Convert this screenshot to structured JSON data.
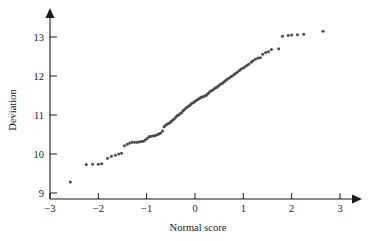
{
  "chart_data": {
    "type": "scatter",
    "title": "",
    "xlabel": "Normal score",
    "ylabel": "Deviation",
    "xlim": [
      -3.2,
      3.3
    ],
    "ylim": [
      8.6,
      13.45
    ],
    "xticks": [
      -3,
      -2,
      -1,
      0,
      1,
      2,
      3
    ],
    "xtick_labels": [
      "−3",
      "−2",
      "−1",
      "0",
      "1",
      "2",
      "3"
    ],
    "yticks": [
      9,
      10,
      11,
      12,
      13
    ],
    "ytick_labels": [
      "9",
      "10",
      "11",
      "12",
      "13"
    ],
    "grid": false,
    "legend": "none",
    "point_color": "#4a4a4a",
    "axis_color": "#1a1a1a",
    "n_points": 100,
    "x": [
      -2.58,
      -2.25,
      -2.12,
      -2.0,
      -1.93,
      -1.81,
      -1.73,
      -1.65,
      -1.58,
      -1.52,
      -1.46,
      -1.4,
      -1.35,
      -1.3,
      -1.25,
      -1.2,
      -1.16,
      -1.11,
      -1.07,
      -1.03,
      -0.99,
      -0.95,
      -0.92,
      -0.88,
      -0.84,
      -0.81,
      -0.77,
      -0.74,
      -0.71,
      -0.67,
      -0.64,
      -0.61,
      -0.58,
      -0.55,
      -0.52,
      -0.49,
      -0.46,
      -0.43,
      -0.4,
      -0.37,
      -0.34,
      -0.31,
      -0.28,
      -0.25,
      -0.23,
      -0.2,
      -0.17,
      -0.14,
      -0.11,
      -0.09,
      -0.06,
      -0.03,
      0.0,
      0.03,
      0.06,
      0.09,
      0.11,
      0.14,
      0.17,
      0.2,
      0.23,
      0.25,
      0.28,
      0.31,
      0.34,
      0.37,
      0.4,
      0.43,
      0.46,
      0.49,
      0.52,
      0.55,
      0.58,
      0.61,
      0.64,
      0.67,
      0.71,
      0.74,
      0.77,
      0.81,
      0.84,
      0.88,
      0.92,
      0.95,
      0.99,
      1.03,
      1.07,
      1.11,
      1.16,
      1.2,
      1.25,
      1.3,
      1.35,
      1.4,
      1.46,
      1.52,
      1.58,
      1.73,
      1.81,
      1.93,
      2.0,
      2.12,
      2.25,
      2.65
    ],
    "y": [
      9.28,
      9.73,
      9.74,
      9.74,
      9.75,
      9.89,
      9.94,
      9.97,
      10.0,
      10.02,
      10.21,
      10.25,
      10.28,
      10.3,
      10.3,
      10.3,
      10.31,
      10.32,
      10.33,
      10.36,
      10.4,
      10.44,
      10.45,
      10.46,
      10.47,
      10.48,
      10.5,
      10.52,
      10.54,
      10.59,
      10.7,
      10.74,
      10.76,
      10.78,
      10.8,
      10.84,
      10.87,
      10.9,
      10.94,
      10.98,
      11.0,
      11.03,
      11.06,
      11.1,
      11.13,
      11.16,
      11.2,
      11.22,
      11.25,
      11.27,
      11.3,
      11.32,
      11.35,
      11.38,
      11.4,
      11.42,
      11.44,
      11.46,
      11.47,
      11.49,
      11.5,
      11.53,
      11.56,
      11.6,
      11.62,
      11.64,
      11.67,
      11.7,
      11.72,
      11.75,
      11.78,
      11.8,
      11.83,
      11.86,
      11.89,
      11.92,
      11.95,
      11.98,
      12.0,
      12.04,
      12.07,
      12.1,
      12.14,
      12.18,
      12.2,
      12.23,
      12.27,
      12.3,
      12.35,
      12.39,
      12.43,
      12.46,
      12.47,
      12.56,
      12.6,
      12.62,
      12.68,
      12.7,
      13.02,
      13.04,
      13.05,
      13.06,
      13.07,
      13.15
    ]
  },
  "axes": {
    "x_title": "Normal score",
    "y_title": "Deviation"
  }
}
